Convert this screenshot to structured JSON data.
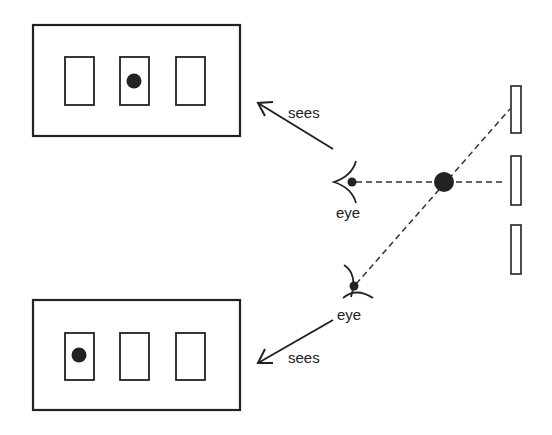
{
  "diagram": {
    "colors": {
      "stroke": "#222222",
      "fill": "#222222",
      "background": "#ffffff"
    },
    "top_view": {
      "label": "sees",
      "eye_label": "eye",
      "slots": 3,
      "dot_in_slot": 2
    },
    "bottom_view": {
      "label": "sees",
      "eye_label": "eye",
      "slots": 3,
      "dot_in_slot": 1
    },
    "scene": {
      "wall_slots": 3,
      "object": "dot"
    }
  }
}
